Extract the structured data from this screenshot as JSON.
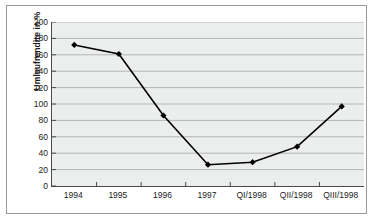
{
  "chart_data": {
    "type": "line",
    "title": "",
    "subtitle": "",
    "xlabel": "",
    "ylabel": "Umlaufrendite in %",
    "categories": [
      "1994",
      "1995",
      "1996",
      "1997",
      "QI/1998",
      "QII/1998",
      "QIII/1998"
    ],
    "values": [
      172,
      161,
      86,
      26,
      29,
      48,
      97
    ],
    "series": [
      {
        "name": "Umlaufrendite in %",
        "values": [
          172,
          161,
          86,
          26,
          29,
          48,
          97
        ]
      }
    ],
    "ylim": [
      0,
      200
    ],
    "ytick_values": [
      0,
      20,
      40,
      60,
      80,
      100,
      120,
      140,
      160,
      180,
      200
    ],
    "ytick_labels": [
      "0",
      "20",
      "40",
      "60",
      "80",
      "100",
      "120",
      "140",
      "160",
      "180",
      "200"
    ],
    "grid": "horizontal",
    "legend": "none",
    "marker": "diamond",
    "line_color": "#000000",
    "marker_color": "#000000",
    "plot_background": "#eceded",
    "axis_color": "#4a4a4a",
    "gridline_color": "#b4b4b4",
    "frame_color": "#9a9a9a",
    "text_color": "#1a1a1a"
  }
}
